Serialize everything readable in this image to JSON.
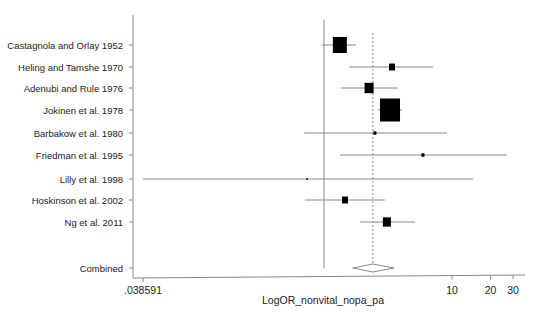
{
  "chart_data": {
    "type": "forest",
    "title": "",
    "xlabel": "LogOR_nonvital_nopa_pa",
    "ylabel": "",
    "x_scale": "log",
    "x_ticks": [
      {
        "label": ".038591",
        "value": 0.038591
      },
      {
        "label": "10",
        "value": 10
      },
      {
        "label": "20",
        "value": 20
      },
      {
        "label": "30",
        "value": 30
      }
    ],
    "null_line": 1,
    "pooled_line": 2.41,
    "studies": [
      {
        "name": "Castagnola and Orlay 1952",
        "or": 1.33,
        "lower": 0.96,
        "upper": 1.78,
        "weight_box": 14
      },
      {
        "name": "Heling and Tamshe 1970",
        "or": 3.4,
        "lower": 1.57,
        "upper": 7.1,
        "weight_box": 6
      },
      {
        "name": "Adenubi and Rule 1976",
        "or": 2.25,
        "lower": 1.36,
        "upper": 3.79,
        "weight_box": 9
      },
      {
        "name": "Jokinen et al. 1978",
        "or": 3.28,
        "lower": 2.64,
        "upper": 4.07,
        "weight_box": 20
      },
      {
        "name": "Barbakow et al. 1980",
        "or": 2.5,
        "lower": 0.7,
        "upper": 9.13,
        "weight_box": 3
      },
      {
        "name": "Friedman et al. 1995",
        "or": 5.93,
        "lower": 1.33,
        "upper": 26.9,
        "weight_box": 3
      },
      {
        "name": "Lilly et al. 1998",
        "or": 0.74,
        "lower": 0.038591,
        "upper": 14.6,
        "weight_box": 1.5
      },
      {
        "name": "Hoskinson et al. 2002",
        "or": 1.46,
        "lower": 0.71,
        "upper": 2.99,
        "weight_box": 6
      },
      {
        "name": "Ng et al. 2011",
        "or": 3.1,
        "lower": 1.91,
        "upper": 5.14,
        "weight_box": 8
      }
    ],
    "combined": {
      "name": "Combined",
      "or": 2.41,
      "lower": 1.68,
      "upper": 3.52
    },
    "grid": false,
    "legend": "none"
  }
}
